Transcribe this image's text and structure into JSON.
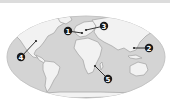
{
  "map": {
    "projection": "world-robinson",
    "colors": {
      "ocean": "#d4d4d4",
      "ocean_edge": "#c2c2c2",
      "land": "#f2f2f2",
      "land_shade": "#a8a8a8",
      "marker": "#1a1a1a",
      "leader": "#222222",
      "background": "#ffffff"
    },
    "markers": [
      {
        "id": "1",
        "label": "1",
        "cx": 68,
        "cy": 31,
        "tx": 82,
        "ty": 33
      },
      {
        "id": "2",
        "label": "2",
        "cx": 149,
        "cy": 48,
        "tx": 134,
        "ty": 48
      },
      {
        "id": "3",
        "label": "3",
        "cx": 104,
        "cy": 26,
        "tx": 86,
        "ty": 30
      },
      {
        "id": "4",
        "label": "4",
        "cx": 21,
        "cy": 57,
        "tx": 36,
        "ty": 41
      },
      {
        "id": "5",
        "label": "5",
        "cx": 108,
        "cy": 79,
        "tx": 95,
        "ty": 66
      }
    ]
  }
}
